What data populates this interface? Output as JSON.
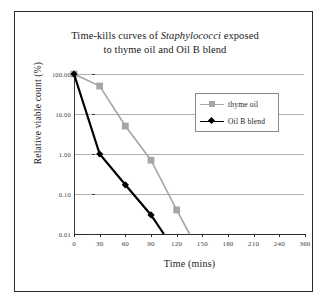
{
  "figure": {
    "title_line1_pre": "Time-kills curves of ",
    "title_species": "Staphylococci",
    "title_line1_post": " exposed",
    "title_line2": "to thyme oil and Oil B blend"
  },
  "colors": {
    "thyme_oil": "#a6a6a6",
    "oil_b_blend": "#000000",
    "gridline": "#b0b0b0",
    "axis": "#2b2b2b",
    "border": "#2b2b2b",
    "text": "#1a1a1a"
  },
  "chart_data": {
    "type": "line",
    "title": "Time-kills curves of Staphylococci exposed to thyme oil and Oil B blend",
    "xlabel": "Time (mins)",
    "ylabel": "Relative viable count (%)",
    "yscale": "log",
    "ylim": [
      0.01,
      100
    ],
    "ytick_labels": [
      "100.00",
      "10.00",
      "1.00",
      "0.10",
      "0.01"
    ],
    "ytick_values": [
      100,
      10,
      1,
      0.1,
      0.01
    ],
    "xlim": [
      0,
      360
    ],
    "xtick_labels": [
      "0",
      "30",
      "60",
      "90",
      "120",
      "150",
      "180",
      "210",
      "240",
      "360"
    ],
    "xtick_values": [
      0,
      30,
      60,
      90,
      120,
      150,
      180,
      210,
      240,
      360
    ],
    "grid": true,
    "legend_position": "upper right",
    "series": [
      {
        "name": "thyme oil",
        "marker": "square",
        "color": "#a6a6a6",
        "x": [
          0,
          30,
          60,
          90,
          120,
          135
        ],
        "y": [
          100,
          50,
          5,
          0.7,
          0.04,
          0.01
        ]
      },
      {
        "name": "Oil B blend",
        "marker": "diamond",
        "color": "#000000",
        "x": [
          0,
          30,
          60,
          90,
          105
        ],
        "y": [
          100,
          1,
          0.17,
          0.03,
          0.01
        ]
      }
    ]
  },
  "legend": {
    "items": [
      {
        "label": "thyme oil",
        "marker": "square-marker",
        "color": "#a6a6a6"
      },
      {
        "label": "Oil B blend",
        "marker": "diamond-marker",
        "color": "#000000"
      }
    ]
  }
}
